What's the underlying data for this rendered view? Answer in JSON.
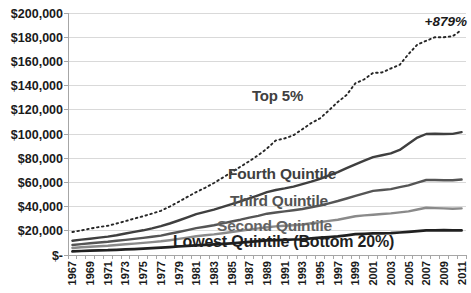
{
  "chart_data": {
    "type": "line",
    "title": "",
    "xlabel": "",
    "ylabel": "",
    "x": [
      1967,
      1968,
      1969,
      1970,
      1971,
      1972,
      1973,
      1974,
      1975,
      1976,
      1977,
      1978,
      1979,
      1980,
      1981,
      1982,
      1983,
      1984,
      1985,
      1986,
      1987,
      1988,
      1989,
      1990,
      1991,
      1992,
      1993,
      1994,
      1995,
      1996,
      1997,
      1998,
      1999,
      2000,
      2001,
      2002,
      2003,
      2004,
      2005,
      2006,
      2007,
      2008,
      2009,
      2010,
      2011
    ],
    "x_tick_labels": [
      "1967",
      "1969",
      "1971",
      "1973",
      "1975",
      "1977",
      "1979",
      "1981",
      "1983",
      "1985",
      "1987",
      "1989",
      "1991",
      "1993",
      "1995",
      "1997",
      "1999",
      "2001",
      "2003",
      "2005",
      "2007",
      "2009",
      "2011"
    ],
    "y_tick_labels": [
      "$200,000",
      "$180,000",
      "$160,000",
      "$140,000",
      "$120,000",
      "$100,000",
      "$80,000",
      "$60,000",
      "$40,000",
      "$20,000",
      "$-"
    ],
    "y_tick_values": [
      200000,
      180000,
      160000,
      140000,
      120000,
      100000,
      80000,
      60000,
      40000,
      20000,
      0
    ],
    "ylim": [
      0,
      200000
    ],
    "grid": true,
    "legend": "inline-labels",
    "series": [
      {
        "name": "Top 5%",
        "style": "dotted",
        "color": "#262626",
        "values": [
          19000,
          20300,
          21800,
          23100,
          24100,
          26000,
          28000,
          30100,
          32100,
          34200,
          36500,
          40000,
          44000,
          48000,
          52000,
          55500,
          59500,
          64000,
          68500,
          73000,
          77500,
          82500,
          88000,
          94700,
          96400,
          99000,
          104000,
          109000,
          113000,
          119500,
          126500,
          132200,
          142000,
          145200,
          150500,
          150800,
          154100,
          157200,
          166000,
          174000,
          177000,
          180000,
          180000,
          180800,
          186000
        ]
      },
      {
        "name": "Fourth Quintile",
        "style": "solid",
        "color": "#3f3f3f",
        "values": [
          11840,
          12700,
          13500,
          14400,
          15200,
          16400,
          17800,
          19100,
          20400,
          22000,
          23800,
          26000,
          28500,
          31100,
          33800,
          35700,
          37500,
          39800,
          42000,
          44400,
          46800,
          49300,
          52000,
          53700,
          55000,
          56500,
          58500,
          60600,
          63000,
          65800,
          68500,
          71700,
          75000,
          78000,
          80900,
          82400,
          84000,
          86900,
          92000,
          97000,
          100000,
          100200,
          100000,
          100100,
          101600
        ]
      },
      {
        "name": "Third Quintile",
        "style": "solid",
        "color": "#555555",
        "values": [
          8300,
          9000,
          9700,
          10300,
          10900,
          11700,
          12500,
          13300,
          14100,
          15000,
          16000,
          17500,
          19000,
          20600,
          22200,
          23400,
          24600,
          26100,
          27700,
          29200,
          30800,
          32400,
          34100,
          35100,
          36000,
          37000,
          38000,
          39400,
          40900,
          42700,
          44600,
          46700,
          48900,
          51000,
          53000,
          53700,
          54500,
          56000,
          57600,
          59800,
          62000,
          62000,
          61800,
          61700,
          62400
        ]
      },
      {
        "name": "Second Quintile",
        "style": "solid",
        "color": "#8a8a8a",
        "values": [
          5800,
          6350,
          6900,
          7300,
          7700,
          8300,
          8900,
          9450,
          10000,
          10650,
          11300,
          12250,
          13300,
          14400,
          15500,
          16250,
          17000,
          18000,
          19000,
          20000,
          21000,
          22000,
          23000,
          23600,
          24100,
          24650,
          25200,
          26200,
          27200,
          28200,
          29200,
          30600,
          32000,
          32700,
          33300,
          33850,
          34400,
          35200,
          36000,
          37600,
          39100,
          38800,
          38500,
          38300,
          38500
        ]
      },
      {
        "name": "Lowest Quintile (Bottom 20%)",
        "style": "solid",
        "color": "#202020",
        "values": [
          3000,
          3300,
          3600,
          3800,
          4000,
          4300,
          4600,
          4900,
          5200,
          5600,
          6000,
          6500,
          7000,
          7500,
          8000,
          8400,
          8800,
          9250,
          9700,
          10250,
          10800,
          11450,
          12100,
          12350,
          12600,
          12800,
          13000,
          13700,
          14400,
          14900,
          15400,
          16300,
          17200,
          17550,
          17900,
          17950,
          18000,
          18600,
          19200,
          19750,
          20300,
          20400,
          20500,
          20400,
          20300
        ]
      }
    ],
    "annotations": [
      {
        "text": "+879%",
        "color": "#1a1a1a",
        "position": "top-right"
      }
    ]
  }
}
